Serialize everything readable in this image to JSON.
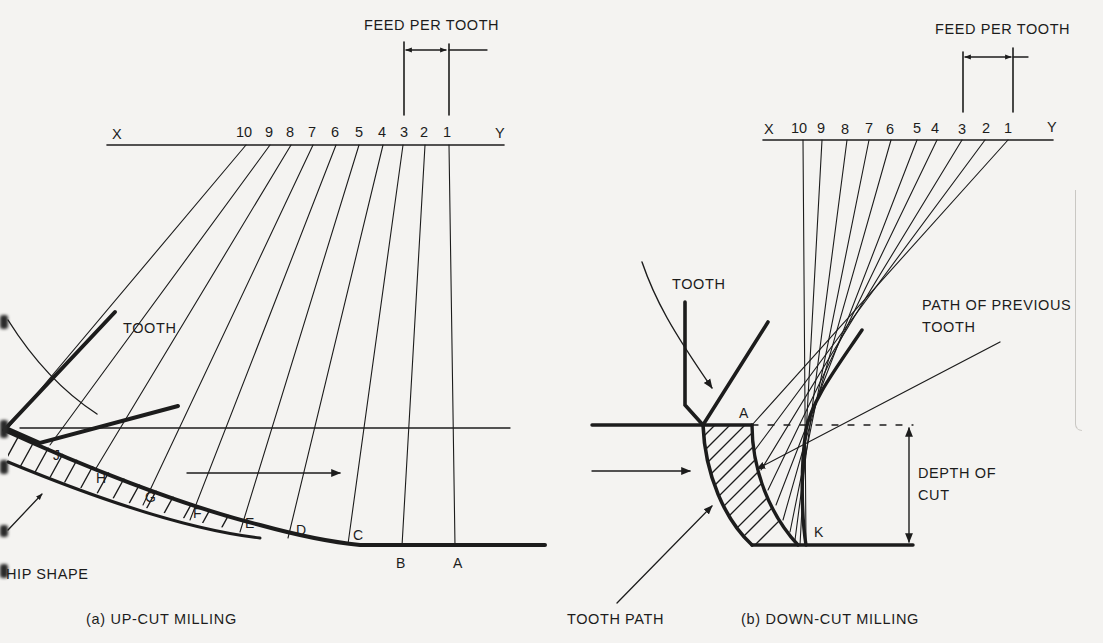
{
  "figure": {
    "colors": {
      "ink": "#1c1c1c",
      "paper": "#f4f3f1"
    },
    "up_cut": {
      "caption": "(a) UP-CUT MILLING",
      "feed_label": "FEED PER TOOTH",
      "axis_start": "X",
      "axis_end": "Y",
      "tooth_positions": [
        "10",
        "9",
        "8",
        "7",
        "6",
        "5",
        "4",
        "3",
        "2",
        "1"
      ],
      "tooth_label": "TOOTH",
      "chip_label": "HIP SHAPE",
      "path_points": [
        "J",
        "H",
        "G",
        "F",
        "E",
        "D",
        "C",
        "B",
        "A"
      ]
    },
    "down_cut": {
      "caption": "(b) DOWN-CUT MILLING",
      "feed_label": "FEED PER TOOTH",
      "axis_start": "X",
      "axis_end": "Y",
      "tooth_positions": [
        "10",
        "9",
        "8",
        "7",
        "6",
        "5",
        "4",
        "3",
        "2",
        "1"
      ],
      "tooth_label": "TOOTH",
      "previous_path_label_line1": "PATH OF PREVIOUS",
      "previous_path_label_line2": "TOOTH",
      "depth_label_line1": "DEPTH OF",
      "depth_label_line2": "CUT",
      "tooth_path_label": "TOOTH PATH",
      "point_a": "A",
      "point_k": "K"
    }
  }
}
